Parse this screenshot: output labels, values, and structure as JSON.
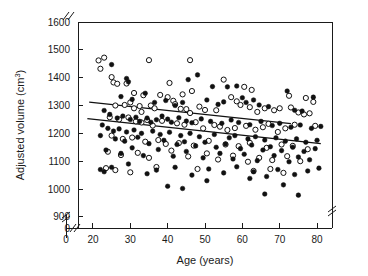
{
  "chart_data": {
    "type": "scatter",
    "title": "",
    "xlabel": "Age (years)",
    "ylabel": "Adjusted volume (cm³)",
    "ylabel_parts": {
      "base": "Adjusted volume (cm",
      "sup": "3",
      "tail": ")"
    },
    "xlim": [
      16,
      84
    ],
    "ylim": [
      860,
      1600
    ],
    "x_ticks": [
      0,
      20,
      30,
      40,
      50,
      60,
      70,
      80
    ],
    "x_tick_labels": [
      "0",
      "20",
      "30",
      "40",
      "50",
      "60",
      "70",
      "80"
    ],
    "y_ticks": [
      0,
      900,
      1000,
      1100,
      1200,
      1300,
      1400,
      1500,
      1600
    ],
    "y_tick_labels": [
      "0",
      "900",
      "1000",
      "1100",
      "1200",
      "1300",
      "1400",
      "1500",
      "1600"
    ],
    "grid": false,
    "legend_position": "none",
    "axis_breaks": [
      {
        "axis": "x",
        "note": "break between 0 and 20"
      },
      {
        "axis": "y",
        "note": "break between 0 and 900"
      },
      {
        "axis": "top",
        "note": "break near left edge"
      },
      {
        "axis": "right",
        "note": "break near bottom"
      }
    ],
    "series": [
      {
        "name": "Open circles",
        "marker": "open-circle",
        "fit_line": {
          "x0": 19.0,
          "y0": 1312,
          "x1": 73.0,
          "y1": 1235
        },
        "points": [
          [
            21.5,
            1462
          ],
          [
            23.0,
            1472
          ],
          [
            22.0,
            1432
          ],
          [
            25.0,
            1402
          ],
          [
            25.5,
            1383
          ],
          [
            26.5,
            1378
          ],
          [
            35.0,
            1463
          ],
          [
            46.0,
            1463
          ],
          [
            29.0,
            1379
          ],
          [
            31.0,
            1345
          ],
          [
            33.5,
            1337
          ],
          [
            40.5,
            1381
          ],
          [
            44.0,
            1340
          ],
          [
            46.5,
            1352
          ],
          [
            55.0,
            1393
          ],
          [
            60.5,
            1367
          ],
          [
            62.5,
            1356
          ],
          [
            72.5,
            1335
          ],
          [
            77.0,
            1327
          ],
          [
            79.0,
            1313
          ],
          [
            26.0,
            1300
          ],
          [
            28.5,
            1302
          ],
          [
            30.0,
            1311
          ],
          [
            31.0,
            1290
          ],
          [
            32.5,
            1298
          ],
          [
            33.0,
            1277
          ],
          [
            35.5,
            1300
          ],
          [
            36.5,
            1290
          ],
          [
            38.0,
            1338
          ],
          [
            40.0,
            1330
          ],
          [
            41.5,
            1317
          ],
          [
            42.0,
            1305
          ],
          [
            43.5,
            1288
          ],
          [
            45.0,
            1287
          ],
          [
            46.0,
            1273
          ],
          [
            48.5,
            1296
          ],
          [
            50.0,
            1284
          ],
          [
            53.0,
            1283
          ],
          [
            57.0,
            1330
          ],
          [
            58.5,
            1315
          ],
          [
            59.5,
            1302
          ],
          [
            62.0,
            1294
          ],
          [
            64.0,
            1277
          ],
          [
            66.0,
            1290
          ],
          [
            68.5,
            1283
          ],
          [
            70.0,
            1290
          ],
          [
            73.0,
            1293
          ],
          [
            75.0,
            1275
          ],
          [
            76.5,
            1268
          ],
          [
            78.0,
            1272
          ],
          [
            24.5,
            1258
          ],
          [
            27.0,
            1250
          ],
          [
            29.5,
            1257
          ],
          [
            31.5,
            1243
          ],
          [
            33.0,
            1239
          ],
          [
            34.5,
            1248
          ],
          [
            36.0,
            1228
          ],
          [
            38.5,
            1245
          ],
          [
            42.5,
            1236
          ],
          [
            44.5,
            1231
          ],
          [
            47.5,
            1240
          ],
          [
            49.5,
            1218
          ],
          [
            52.5,
            1230
          ],
          [
            54.0,
            1224
          ],
          [
            56.0,
            1212
          ],
          [
            58.0,
            1219
          ],
          [
            61.0,
            1227
          ],
          [
            63.5,
            1213
          ],
          [
            65.5,
            1222
          ],
          [
            67.0,
            1234
          ],
          [
            69.5,
            1205
          ],
          [
            71.5,
            1218
          ],
          [
            74.0,
            1231
          ],
          [
            79.5,
            1227
          ],
          [
            25.0,
            1192
          ],
          [
            28.0,
            1180
          ],
          [
            30.5,
            1185
          ],
          [
            34.0,
            1170
          ],
          [
            37.5,
            1176
          ],
          [
            39.5,
            1162
          ],
          [
            43.0,
            1165
          ],
          [
            47.0,
            1156
          ],
          [
            51.0,
            1173
          ],
          [
            55.5,
            1160
          ],
          [
            59.0,
            1154
          ],
          [
            62.0,
            1166
          ],
          [
            66.5,
            1148
          ],
          [
            70.5,
            1160
          ],
          [
            73.5,
            1155
          ],
          [
            77.5,
            1143
          ],
          [
            24.0,
            1134
          ],
          [
            27.5,
            1122
          ],
          [
            32.0,
            1130
          ],
          [
            35.0,
            1112
          ],
          [
            41.0,
            1138
          ],
          [
            45.5,
            1117
          ],
          [
            50.5,
            1128
          ],
          [
            53.5,
            1106
          ],
          [
            57.5,
            1120
          ],
          [
            61.5,
            1098
          ],
          [
            64.5,
            1112
          ],
          [
            68.0,
            1104
          ],
          [
            72.0,
            1118
          ],
          [
            75.5,
            1100
          ],
          [
            23.5,
            1075
          ],
          [
            26.0,
            1068
          ],
          [
            30.0,
            1060
          ],
          [
            37.0,
            1079
          ],
          [
            48.0,
            1072
          ],
          [
            63.0,
            1065
          ],
          [
            67.5,
            1072
          ],
          [
            71.0,
            1058
          ]
        ]
      },
      {
        "name": "Filled circles",
        "marker": "filled-circle",
        "fit_line": {
          "x0": 18.5,
          "y0": 1253,
          "x1": 81.0,
          "y1": 1163
        },
        "points": [
          [
            25.0,
            1447
          ],
          [
            29.5,
            1385
          ],
          [
            29.0,
            1397
          ],
          [
            48.0,
            1410
          ],
          [
            45.5,
            1393
          ],
          [
            52.0,
            1368
          ],
          [
            56.0,
            1367
          ],
          [
            58.5,
            1370
          ],
          [
            72.0,
            1352
          ],
          [
            79.0,
            1330
          ],
          [
            27.5,
            1332
          ],
          [
            30.5,
            1322
          ],
          [
            34.0,
            1344
          ],
          [
            36.5,
            1311
          ],
          [
            39.5,
            1318
          ],
          [
            42.0,
            1300
          ],
          [
            44.0,
            1311
          ],
          [
            50.5,
            1320
          ],
          [
            53.5,
            1304
          ],
          [
            55.0,
            1313
          ],
          [
            60.0,
            1328
          ],
          [
            61.0,
            1311
          ],
          [
            63.0,
            1320
          ],
          [
            64.5,
            1302
          ],
          [
            67.0,
            1296
          ],
          [
            74.0,
            1283
          ],
          [
            76.0,
            1280
          ],
          [
            23.0,
            1282
          ],
          [
            24.5,
            1268
          ],
          [
            26.5,
            1255
          ],
          [
            28.0,
            1262
          ],
          [
            30.0,
            1250
          ],
          [
            31.5,
            1258
          ],
          [
            32.5,
            1243
          ],
          [
            34.5,
            1255
          ],
          [
            35.5,
            1240
          ],
          [
            37.0,
            1249
          ],
          [
            38.5,
            1262
          ],
          [
            40.0,
            1251
          ],
          [
            41.0,
            1240
          ],
          [
            43.0,
            1256
          ],
          [
            45.0,
            1244
          ],
          [
            46.5,
            1238
          ],
          [
            49.0,
            1252
          ],
          [
            51.5,
            1243
          ],
          [
            54.5,
            1236
          ],
          [
            57.0,
            1248
          ],
          [
            59.0,
            1239
          ],
          [
            62.0,
            1231
          ],
          [
            65.0,
            1243
          ],
          [
            68.0,
            1228
          ],
          [
            70.0,
            1236
          ],
          [
            73.0,
            1222
          ],
          [
            75.5,
            1230
          ],
          [
            78.5,
            1218
          ],
          [
            81.0,
            1225
          ],
          [
            22.5,
            1230
          ],
          [
            24.0,
            1218
          ],
          [
            25.5,
            1208
          ],
          [
            27.0,
            1216
          ],
          [
            29.0,
            1205
          ],
          [
            31.0,
            1212
          ],
          [
            33.0,
            1200
          ],
          [
            36.0,
            1208
          ],
          [
            38.0,
            1196
          ],
          [
            40.5,
            1204
          ],
          [
            43.5,
            1192
          ],
          [
            46.0,
            1200
          ],
          [
            48.5,
            1188
          ],
          [
            52.5,
            1196
          ],
          [
            56.5,
            1184
          ],
          [
            58.0,
            1192
          ],
          [
            61.5,
            1180
          ],
          [
            63.5,
            1188
          ],
          [
            66.0,
            1176
          ],
          [
            69.0,
            1184
          ],
          [
            71.5,
            1172
          ],
          [
            74.5,
            1180
          ],
          [
            77.0,
            1168
          ],
          [
            80.0,
            1175
          ],
          [
            22.0,
            1192
          ],
          [
            26.0,
            1180
          ],
          [
            28.5,
            1172
          ],
          [
            32.0,
            1186
          ],
          [
            35.0,
            1163
          ],
          [
            39.0,
            1175
          ],
          [
            42.5,
            1160
          ],
          [
            44.5,
            1170
          ],
          [
            47.5,
            1155
          ],
          [
            50.0,
            1168
          ],
          [
            53.0,
            1150
          ],
          [
            55.5,
            1162
          ],
          [
            59.5,
            1145
          ],
          [
            62.5,
            1158
          ],
          [
            65.5,
            1140
          ],
          [
            67.5,
            1152
          ],
          [
            70.5,
            1138
          ],
          [
            73.5,
            1150
          ],
          [
            76.5,
            1135
          ],
          [
            79.5,
            1145
          ],
          [
            23.5,
            1140
          ],
          [
            27.5,
            1128
          ],
          [
            30.5,
            1148
          ],
          [
            33.5,
            1120
          ],
          [
            37.5,
            1142
          ],
          [
            41.5,
            1118
          ],
          [
            45.0,
            1135
          ],
          [
            49.5,
            1112
          ],
          [
            54.0,
            1128
          ],
          [
            57.5,
            1108
          ],
          [
            60.5,
            1125
          ],
          [
            64.0,
            1102
          ],
          [
            68.5,
            1120
          ],
          [
            72.5,
            1098
          ],
          [
            75.0,
            1115
          ],
          [
            78.0,
            1105
          ],
          [
            22.0,
            1070
          ],
          [
            23.0,
            1062
          ],
          [
            25.0,
            1078
          ],
          [
            29.5,
            1090
          ],
          [
            34.5,
            1055
          ],
          [
            37.0,
            1068
          ],
          [
            42.0,
            1078
          ],
          [
            46.5,
            1050
          ],
          [
            51.0,
            1072
          ],
          [
            55.0,
            1058
          ],
          [
            58.5,
            1080
          ],
          [
            63.0,
            1062
          ],
          [
            66.5,
            1045
          ],
          [
            69.5,
            1070
          ],
          [
            74.0,
            1052
          ],
          [
            77.5,
            1065
          ],
          [
            80.5,
            1075
          ],
          [
            40.0,
            1010
          ],
          [
            44.0,
            1002
          ],
          [
            50.5,
            1030
          ],
          [
            62.0,
            1038
          ],
          [
            66.0,
            982
          ],
          [
            71.0,
            1015
          ],
          [
            75.0,
            978
          ]
        ]
      }
    ]
  },
  "axis": {
    "x_title": "Age (years)",
    "y_title_base": "Adjusted volume (cm",
    "y_title_sup": "3",
    "y_title_tail": ")"
  }
}
